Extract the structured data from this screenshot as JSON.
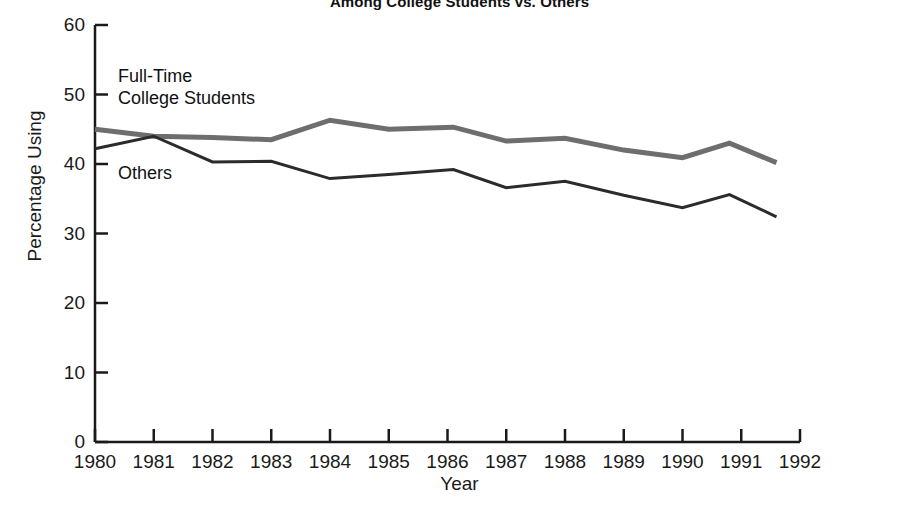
{
  "chart_data": {
    "type": "line",
    "title": "Among College Students vs. Others",
    "xlabel": "Year",
    "ylabel": "Percentage Using",
    "xlim": [
      1980,
      1992
    ],
    "ylim": [
      0,
      60
    ],
    "yticks": [
      0,
      10,
      20,
      30,
      40,
      50,
      60
    ],
    "xticks": [
      1980,
      1981,
      1982,
      1983,
      1984,
      1985,
      1986,
      1987,
      1988,
      1989,
      1990,
      1991,
      1992
    ],
    "grid": false,
    "legend_position": "inline-annotations",
    "series": [
      {
        "name": "Full-Time College Students",
        "color": "#6e6e6e",
        "line_width": 5,
        "x": [
          1980.0,
          1981.0,
          1982.0,
          1983.0,
          1984.0,
          1985.0,
          1986.1,
          1987.0,
          1988.0,
          1989.0,
          1990.0,
          1990.8,
          1991.6
        ],
        "values": [
          45.0,
          44.0,
          43.8,
          43.5,
          46.3,
          45.0,
          45.3,
          43.3,
          43.7,
          42.0,
          40.9,
          43.0,
          40.2
        ]
      },
      {
        "name": "Others",
        "color": "#2b2b2b",
        "line_width": 3,
        "x": [
          1980.0,
          1981.0,
          1982.0,
          1983.0,
          1984.0,
          1985.0,
          1986.1,
          1987.0,
          1988.0,
          1989.0,
          1990.0,
          1990.8,
          1991.6
        ],
        "values": [
          42.2,
          44.0,
          40.3,
          40.4,
          37.9,
          38.5,
          39.2,
          36.6,
          37.5,
          35.5,
          33.7,
          35.6,
          32.4
        ]
      }
    ],
    "annotations": [
      {
        "name": "full-time-college-students",
        "line1": "Full-Time",
        "line2": "College Students"
      },
      {
        "name": "others",
        "line1": "Others",
        "line2": ""
      }
    ]
  }
}
